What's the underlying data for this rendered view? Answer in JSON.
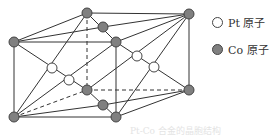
{
  "legend": {
    "items": [
      {
        "label": "Pt 原子",
        "type": "pt",
        "color": "#ffffff"
      },
      {
        "label": "Co 原子",
        "type": "co",
        "color": "#808080"
      }
    ]
  },
  "structure": {
    "co_color": "#808080",
    "pt_color": "#ffffff",
    "line_color": "#333333"
  },
  "caption": "Pt-Co 合金的晶胞结构"
}
